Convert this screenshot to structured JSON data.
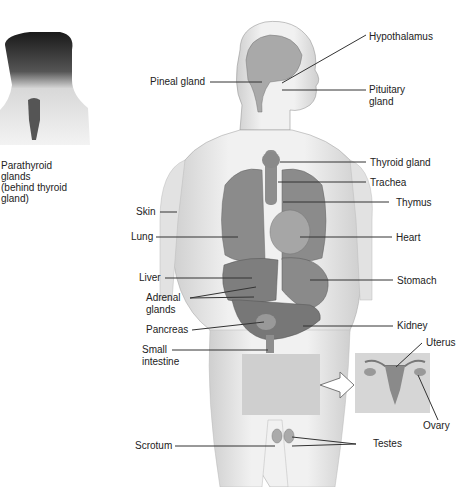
{
  "diagram": {
    "inset": {
      "caption": [
        "Parathyroid",
        "glands",
        "(behind thyroid",
        "gland)"
      ]
    },
    "labels_left": {
      "pineal": "Pineal gland",
      "skin": "Skin",
      "lung": "Lung",
      "liver": "Liver",
      "adrenal_1": "Adrenal",
      "adrenal_2": "glands",
      "pancreas": "Pancreas",
      "small_1": "Small",
      "small_2": "intestine",
      "scrotum": "Scrotum"
    },
    "labels_right": {
      "hypothalamus": "Hypothalamus",
      "pituitary_1": "Pituitary",
      "pituitary_2": "gland",
      "thyroid": "Thyroid gland",
      "trachea": "Trachea",
      "thymus": "Thymus",
      "heart": "Heart",
      "stomach": "Stomach",
      "kidney": "Kidney",
      "uterus": "Uterus",
      "ovary": "Ovary",
      "testes": "Testes"
    },
    "colors": {
      "skin": "#e9e9e9",
      "organ": "#8a8a8a",
      "organ_dark": "#6e6e6e",
      "line": "#333333",
      "overlay": "#cfcfcf"
    }
  }
}
